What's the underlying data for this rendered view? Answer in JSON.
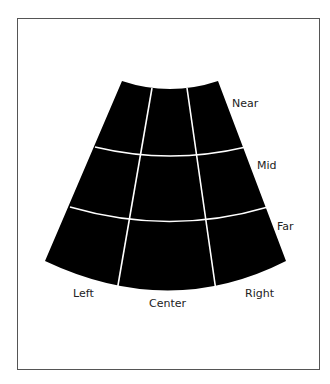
{
  "diagram": {
    "title": "",
    "colors": {
      "fill": "#000000",
      "grid": "#ffffff",
      "border": "#555555",
      "text": "#222222"
    },
    "depth_labels": [
      "Near",
      "Mid",
      "Far"
    ],
    "lateral_labels": [
      "Left",
      "Center",
      "Right"
    ],
    "grid": {
      "rows": 3,
      "cols": 3
    }
  }
}
